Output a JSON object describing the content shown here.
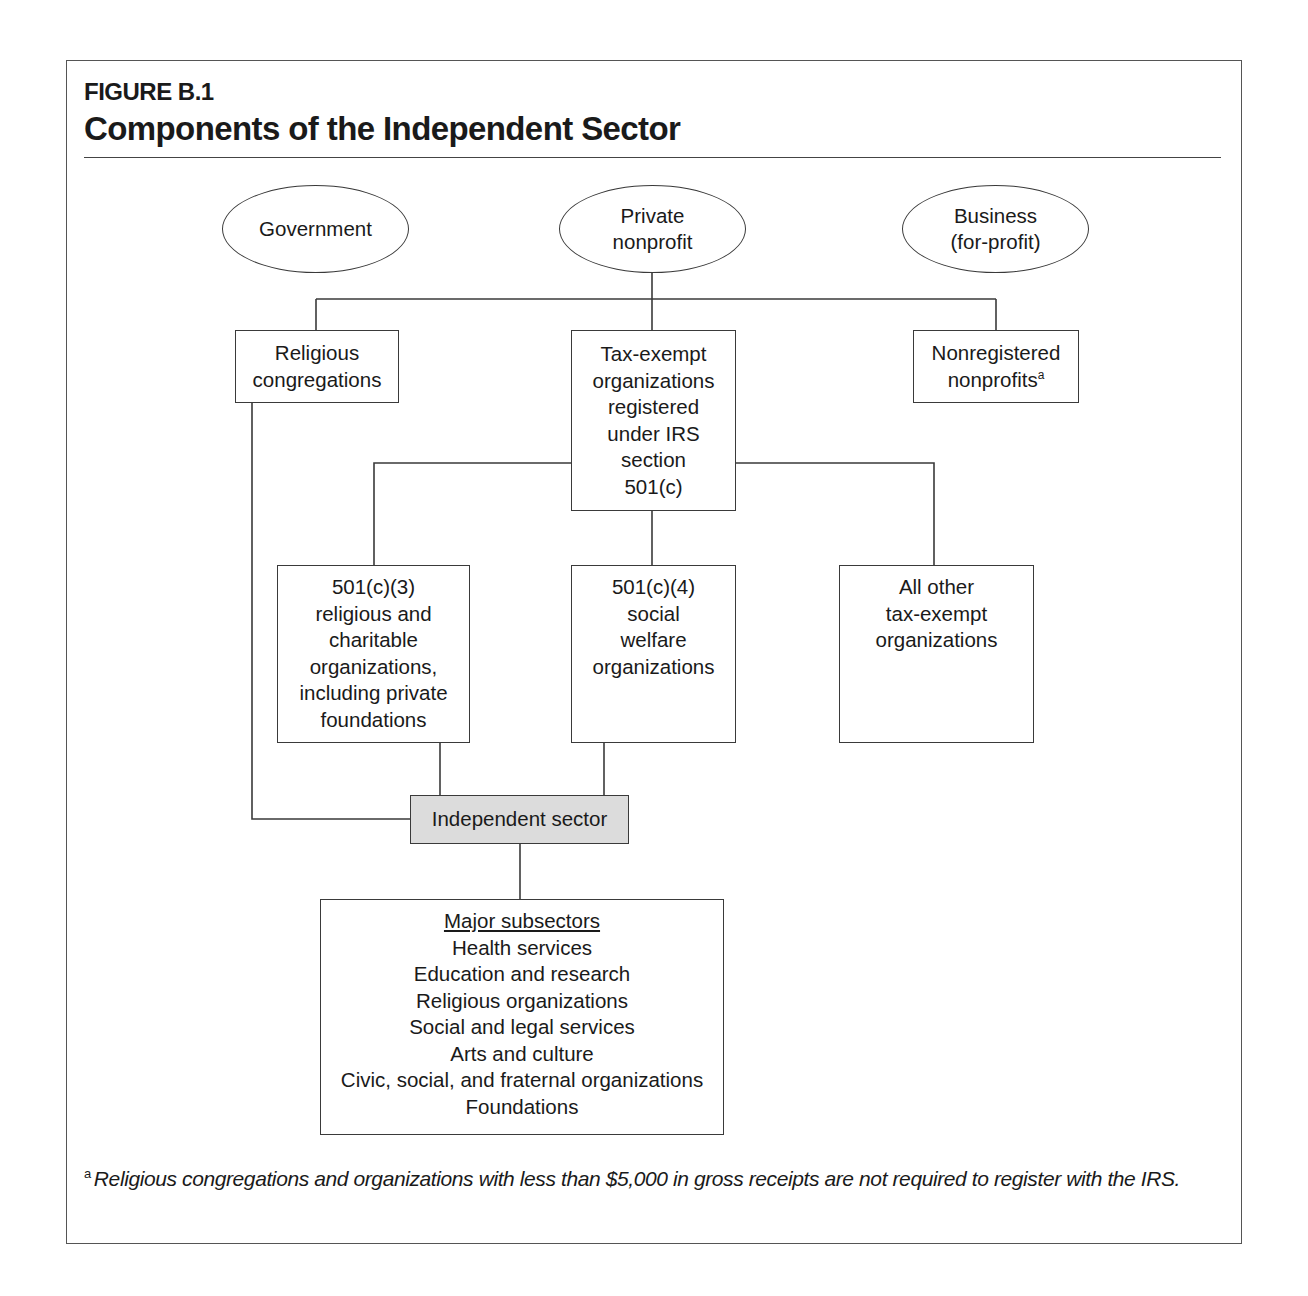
{
  "figure": {
    "label": "FIGURE B.1",
    "title": "Components of the Independent Sector"
  },
  "sectors": {
    "government": "Government",
    "private_nonprofit": [
      "Private",
      "nonprofit"
    ],
    "business": [
      "Business",
      "(for-profit)"
    ]
  },
  "level2": {
    "religious_congregations": [
      "Religious",
      "congregations"
    ],
    "tax_exempt": [
      "Tax-exempt",
      "organizations",
      "registered",
      "under IRS",
      "section",
      "501(c)"
    ],
    "nonregistered": [
      "Nonregistered",
      "nonprofits"
    ],
    "nonregistered_footnote_marker": "a"
  },
  "level3": {
    "c3": [
      "501(c)(3)",
      "religious and",
      "charitable",
      "organizations,",
      "including private",
      "foundations"
    ],
    "c4": [
      "501(c)(4)",
      "social",
      "welfare",
      "organizations"
    ],
    "other": [
      "All other",
      "tax-exempt",
      "organizations"
    ]
  },
  "independent_sector": "Independent sector",
  "subsectors": {
    "heading": "Major subsectors",
    "items": [
      "Health services",
      "Education and research",
      "Religious organizations",
      "Social and legal services",
      "Arts and culture",
      "Civic, social, and fraternal organizations",
      "Foundations"
    ]
  },
  "footnote": {
    "marker": "a",
    "text": "Religious congregations and organizations with less than $5,000 in gross receipts are not required to register with the IRS."
  },
  "colors": {
    "line": "#3a3a3a",
    "highlight_fill": "#dcdcdc"
  }
}
